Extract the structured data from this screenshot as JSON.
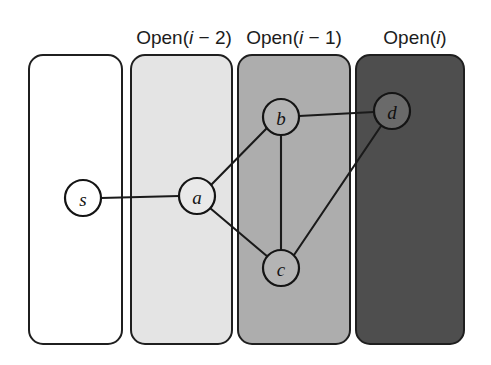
{
  "figure": {
    "background_color": "#ffffff",
    "width": 491,
    "height": 365
  },
  "labels": [
    {
      "id": "label-open-i-minus-2",
      "full_text": "Open(i − 2)",
      "prefix": "Open(",
      "variable": "i",
      "suffix": " − 2)",
      "x": 184,
      "y": 44
    },
    {
      "id": "label-open-i-minus-1",
      "full_text": "Open(i − 1)",
      "prefix": "Open(",
      "variable": "i",
      "suffix": " − 1)",
      "x": 294,
      "y": 44
    },
    {
      "id": "label-open-i",
      "full_text": "Open(i)",
      "prefix": "Open(",
      "variable": "i",
      "suffix": ")",
      "x": 415,
      "y": 44
    }
  ],
  "panels": [
    {
      "id": "panel-closed",
      "name": "closed-panel",
      "fill": "#ffffff",
      "stroke": "#1f1f1f",
      "x": 29,
      "y": 55,
      "width": 93,
      "height": 289,
      "radius": 14,
      "label": ""
    },
    {
      "id": "panel-open-i-minus-2",
      "name": "open-i-minus-2-panel",
      "fill": "#e4e4e4",
      "stroke": "#8a8a8a",
      "x": 131,
      "y": 55,
      "width": 101,
      "height": 289,
      "radius": 14,
      "label": "Open(i − 2)"
    },
    {
      "id": "panel-open-i-minus-1",
      "name": "open-i-minus-1-panel",
      "fill": "#adadad",
      "stroke": "#6f6f6f",
      "x": 238,
      "y": 55,
      "width": 112,
      "height": 289,
      "radius": 14,
      "label": "Open(i − 1)"
    },
    {
      "id": "panel-open-i",
      "name": "open-i-panel",
      "fill": "#4e4e4e",
      "stroke": "#2e2e2e",
      "x": 356,
      "y": 55,
      "width": 108,
      "height": 289,
      "radius": 14,
      "label": "Open(i)"
    }
  ],
  "nodes": [
    {
      "id": "s",
      "label": "s",
      "cx": 83,
      "cy": 198,
      "r": 18,
      "fill": "#ffffff",
      "on_dark": false
    },
    {
      "id": "a",
      "label": "a",
      "cx": 197,
      "cy": 196,
      "r": 18,
      "fill": "#e9e9e9",
      "on_dark": false
    },
    {
      "id": "b",
      "label": "b",
      "cx": 281,
      "cy": 117,
      "r": 18,
      "fill": "#b4b4b4",
      "on_dark": false
    },
    {
      "id": "c",
      "label": "c",
      "cx": 281,
      "cy": 268,
      "r": 18,
      "fill": "#b4b4b4",
      "on_dark": false
    },
    {
      "id": "d",
      "label": "d",
      "cx": 392,
      "cy": 111,
      "r": 18,
      "fill": "#6a6a6a",
      "on_dark": true
    }
  ],
  "edges": [
    {
      "id": "edge-s-a",
      "from": "s",
      "to": "a",
      "x1": 101,
      "y1": 198,
      "x2": 179,
      "y2": 196
    },
    {
      "id": "edge-a-b",
      "from": "a",
      "to": "b",
      "x1": 211,
      "y1": 185,
      "x2": 267,
      "y2": 128
    },
    {
      "id": "edge-a-c",
      "from": "a",
      "to": "c",
      "x1": 210,
      "y1": 208,
      "x2": 268,
      "y2": 257
    },
    {
      "id": "edge-b-c",
      "from": "b",
      "to": "c",
      "x1": 281,
      "y1": 135,
      "x2": 281,
      "y2": 250
    },
    {
      "id": "edge-b-d",
      "from": "b",
      "to": "d",
      "x1": 299,
      "y1": 116,
      "x2": 374,
      "y2": 112
    },
    {
      "id": "edge-c-d",
      "from": "c",
      "to": "d",
      "x1": 294,
      "y1": 255,
      "x2": 381,
      "y2": 126
    }
  ]
}
